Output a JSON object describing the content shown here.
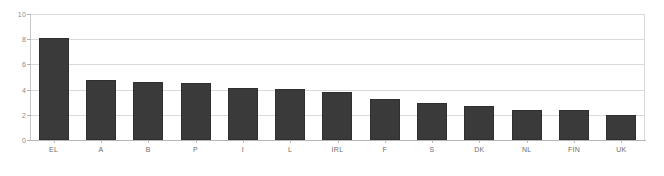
{
  "chart_data": {
    "type": "bar",
    "title": "",
    "subtitle": "",
    "xlabel": "",
    "ylabel": "",
    "categories": [
      "EL",
      "A",
      "B",
      "P",
      "I",
      "L",
      "IRL",
      "F",
      "S",
      "DK",
      "NL",
      "FIN",
      "UK"
    ],
    "values": [
      8.1,
      4.8,
      4.6,
      4.55,
      4.15,
      4.05,
      3.8,
      3.25,
      2.95,
      2.7,
      2.4,
      2.35,
      2.0
    ],
    "series": [
      {
        "name": "",
        "values": [
          8.1,
          4.8,
          4.6,
          4.55,
          4.15,
          4.05,
          3.8,
          3.25,
          2.95,
          2.7,
          2.4,
          2.35,
          2.0
        ]
      }
    ],
    "ylim": [
      0,
      10
    ],
    "ytick_values": [
      0,
      2,
      4,
      6,
      8,
      10
    ],
    "ytick_labels": [
      "0",
      "2",
      "4",
      "6",
      "8",
      "10"
    ],
    "grid": true,
    "grid_axis": "y",
    "legend": false,
    "legend_position": "none",
    "bar_color": "#3a3a3a",
    "grid_color": "#d9d9d9",
    "axis_color": "#b6b6b6",
    "label_color": "#6d6d6d",
    "background_color": "#ffffff"
  }
}
